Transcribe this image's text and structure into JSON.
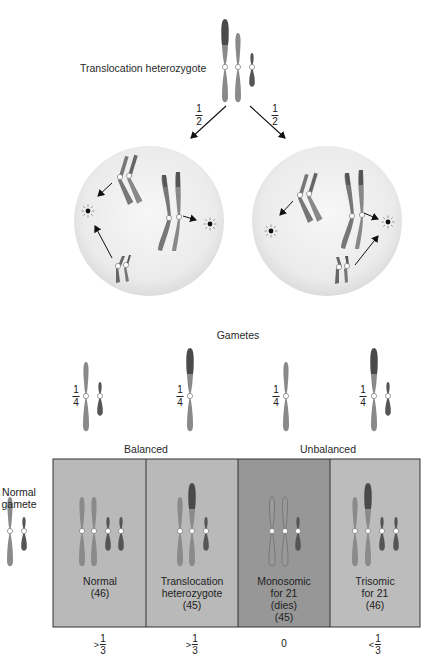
{
  "figure": {
    "parent": {
      "label": "Translocation heterozygote",
      "left_branch_probability": {
        "num": "1",
        "den": "2"
      },
      "right_branch_probability": {
        "num": "1",
        "den": "2"
      }
    },
    "cells": [
      {
        "name": "alternate-segregation-cell"
      },
      {
        "name": "adjacent-segregation-cell"
      }
    ],
    "gametes": {
      "title": "Gametes",
      "items": [
        {
          "probability": {
            "num": "1",
            "den": "4"
          },
          "content": "normal 14 + normal 21"
        },
        {
          "probability": {
            "num": "1",
            "den": "4"
          },
          "content": "translocation 14/21"
        },
        {
          "probability": {
            "num": "1",
            "den": "4"
          },
          "content": "normal 14 only"
        },
        {
          "probability": {
            "num": "1",
            "den": "4"
          },
          "content": "translocation 14/21 + normal 21"
        }
      ]
    },
    "normal_gamete": {
      "line1": "Normal",
      "line2": "gamete"
    },
    "group_headers": {
      "balanced": "Balanced",
      "unbalanced": "Unbalanced"
    },
    "zygotes": [
      {
        "lines": [
          "Normal",
          "(46)"
        ],
        "frequency": {
          "symbol": ">",
          "num": "1",
          "den": "3"
        },
        "fill": "#b9b9b9"
      },
      {
        "lines": [
          "Translocation",
          "heterozygote",
          "(45)"
        ],
        "frequency": {
          "symbol": ">",
          "num": "1",
          "den": "3"
        },
        "fill": "#b9b9b9"
      },
      {
        "lines": [
          "Monosomic",
          "for 21",
          "(dies)",
          "(45)"
        ],
        "frequency": {
          "value": "0"
        },
        "fill": "#979797"
      },
      {
        "lines": [
          "Trisomic",
          "for 21",
          "(46)"
        ],
        "frequency": {
          "symbol": "<",
          "num": "1",
          "den": "3"
        },
        "fill": "#bcbcbc"
      }
    ],
    "colors": {
      "chromosome_light": "#8a8a8a",
      "chromosome_dark": "#555555",
      "translocated_segment": "#4a4a4a",
      "cell_fill": "#ececec",
      "box_border": "#333333"
    }
  }
}
